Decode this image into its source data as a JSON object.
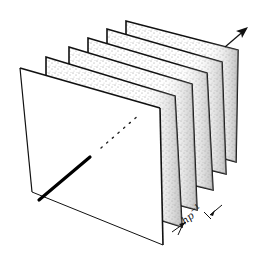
{
  "diagram": {
    "plane_count": 6,
    "spacing_label": {
      "base": "hp",
      "exponent": "−1"
    },
    "colors": {
      "stroke": "#111111",
      "background": "#ffffff",
      "stipple": "#333333"
    },
    "planes": [
      {
        "tl": [
          126,
          21
        ],
        "tr": [
          238,
          50
        ],
        "br": [
          236,
          162
        ],
        "bl": [
          126,
          132
        ]
      },
      {
        "tl": [
          107,
          29
        ],
        "tr": [
          222,
          62
        ],
        "br": [
          226,
          174
        ],
        "bl": [
          107,
          145
        ]
      },
      {
        "tl": [
          88,
          38
        ],
        "tr": [
          207,
          73
        ],
        "br": [
          213,
          190
        ],
        "bl": [
          88,
          160
        ]
      },
      {
        "tl": [
          69,
          47
        ],
        "tr": [
          192,
          84
        ],
        "br": [
          197,
          210
        ],
        "bl": [
          69,
          176
        ]
      },
      {
        "tl": [
          46,
          57
        ],
        "tr": [
          175,
          96
        ],
        "br": [
          182,
          227
        ],
        "bl": [
          46,
          185
        ]
      },
      {
        "tl": [
          20,
          68
        ],
        "tr": [
          160,
          108
        ],
        "br": [
          163,
          245
        ],
        "bl": [
          32,
          192
        ]
      }
    ],
    "solid_line": {
      "from": [
        39,
        200
      ],
      "to": [
        90,
        157
      ]
    },
    "dotted_line": {
      "from": [
        101,
        148
      ],
      "to": [
        140,
        114
      ]
    },
    "arrow": {
      "from": [
        225,
        47
      ],
      "to": [
        247,
        28
      ]
    },
    "dimension_marks": {
      "left": {
        "from": [
          172,
          232
        ],
        "to": [
          186,
          222
        ]
      },
      "right": {
        "from": [
          210,
          215
        ],
        "to": [
          222,
          205
        ]
      }
    }
  }
}
